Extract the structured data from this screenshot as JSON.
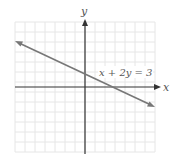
{
  "chart_data": {
    "type": "line",
    "title": "",
    "xlabel": "x",
    "ylabel": "y",
    "xlim": [
      -7,
      7
    ],
    "ylim": [
      -6.5,
      7
    ],
    "grid": true,
    "legend": null,
    "series": [
      {
        "name": "x + 2y = 3",
        "equation": "x + 2y = 3",
        "x": [
          -7,
          0,
          3,
          7
        ],
        "y": [
          5,
          1.5,
          0,
          -2
        ],
        "arrows": "both"
      }
    ],
    "annotations": [
      {
        "text": "x + 2y = 3",
        "x": 2.5,
        "y": 2.2
      }
    ]
  },
  "labels": {
    "x_axis": "x",
    "y_axis": "y",
    "equation": "x + 2y = 3"
  },
  "colors": {
    "grid": "#e6e6e6",
    "axis": "#333333",
    "line": "#777777",
    "text": "#555555"
  }
}
